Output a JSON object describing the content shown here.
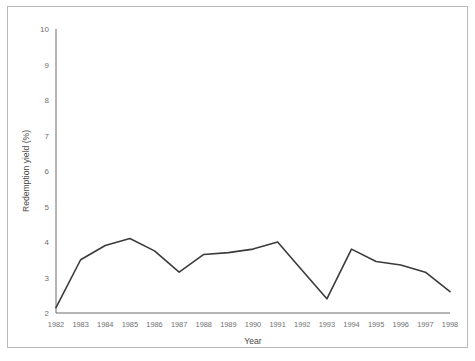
{
  "chart_data": {
    "type": "line",
    "title": "",
    "xlabel": "Year",
    "ylabel": "Redemption yield (%)",
    "categories": [
      "1982",
      "1983",
      "1984",
      "1985",
      "1986",
      "1987",
      "1988",
      "1989",
      "1990",
      "1991",
      "1992",
      "1993",
      "1994",
      "1995",
      "1996",
      "1997",
      "1998"
    ],
    "x": [
      1982,
      1983,
      1984,
      1985,
      1986,
      1987,
      1988,
      1989,
      1990,
      1991,
      1992,
      1993,
      1994,
      1995,
      1996,
      1997,
      1998
    ],
    "values": [
      2.15,
      3.5,
      3.9,
      4.1,
      3.75,
      3.15,
      3.65,
      3.7,
      3.8,
      4.0,
      3.2,
      2.4,
      3.8,
      3.45,
      3.35,
      3.15,
      2.6
    ],
    "series": [
      {
        "name": "Redemption yield",
        "values": [
          2.15,
          3.5,
          3.9,
          4.1,
          3.75,
          3.15,
          3.65,
          3.7,
          3.8,
          4.0,
          3.2,
          2.4,
          3.8,
          3.45,
          3.35,
          3.15,
          2.6
        ],
        "color": "#3b3b3b"
      }
    ],
    "ylim": [
      2,
      10
    ],
    "xlim": [
      1982,
      1998
    ],
    "yticks": [
      2,
      3,
      4,
      5,
      6,
      7,
      8,
      9,
      10
    ],
    "ytick_labels": [
      "2",
      "3",
      "4",
      "5",
      "6",
      "7",
      "8",
      "9",
      "10"
    ],
    "xtick_labels": [
      "1982",
      "1983",
      "1984",
      "1985",
      "1986",
      "1987",
      "1988",
      "1989",
      "1990",
      "1991",
      "1992",
      "1993",
      "1994",
      "1995",
      "1996",
      "1997",
      "1998"
    ],
    "grid": false,
    "legend": null,
    "legend_position": "none",
    "annotations": []
  },
  "figure": {
    "frame_color": "#b9b9b9",
    "axis_color": "#6b6b6b",
    "background": "#ffffff"
  }
}
